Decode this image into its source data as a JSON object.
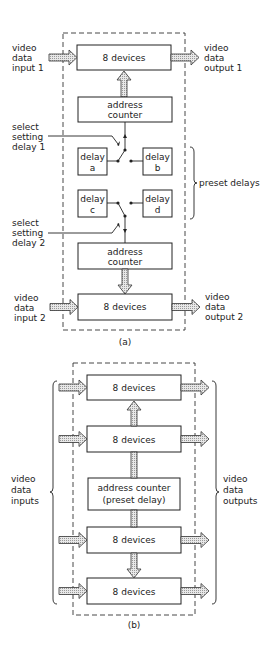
{
  "figure_a": {
    "caption": "(a)",
    "top_devices": "8 devices",
    "bottom_devices": "8 devices",
    "address_counter_1": [
      "address",
      "counter"
    ],
    "address_counter_2": [
      "address",
      "counter"
    ],
    "delays": {
      "a": [
        "delay",
        "a"
      ],
      "b": [
        "delay",
        "b"
      ],
      "c": [
        "delay",
        "c"
      ],
      "d": [
        "delay",
        "d"
      ]
    },
    "input_1": [
      "video",
      "data",
      "input 1"
    ],
    "output_1": [
      "video",
      "data",
      "output 1"
    ],
    "input_2": [
      "video",
      "data",
      "input 2"
    ],
    "output_2": [
      "video",
      "data",
      "output 2"
    ],
    "select_1": [
      "select",
      "setting",
      "delay 1"
    ],
    "select_2": [
      "select",
      "setting",
      "delay 2"
    ],
    "preset_delays": "preset delays"
  },
  "figure_b": {
    "caption": "(b)",
    "devices": [
      "8 devices",
      "8 devices",
      "8 devices",
      "8 devices"
    ],
    "address_counter": [
      "address counter",
      "(preset delay)"
    ],
    "inputs": [
      "video",
      "data",
      "inputs"
    ],
    "outputs": [
      "video",
      "data",
      "outputs"
    ]
  }
}
